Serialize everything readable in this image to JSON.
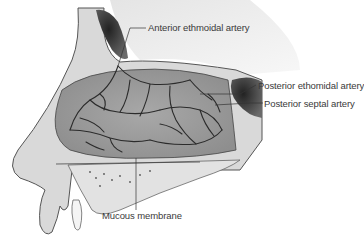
{
  "figure": {
    "labels": [
      {
        "id": "anterior-ethmoidal-artery",
        "text": "Anterior ethmoidal artery"
      },
      {
        "id": "posterior-ethmoidal-artery",
        "text": "Posterior ethomidal artery"
      },
      {
        "id": "posterior-septal-artery",
        "text": "Posterior septal artery"
      },
      {
        "id": "mucous-membrane",
        "text": "Mucous membrane"
      }
    ],
    "colors": {
      "background": "#ffffff",
      "tissue": "#b8b8b8",
      "bone": "#e6e6e6",
      "vessels": "#2b2b2b",
      "sinus": "#3a3a3a",
      "label_text": "#3a3a3a"
    }
  }
}
